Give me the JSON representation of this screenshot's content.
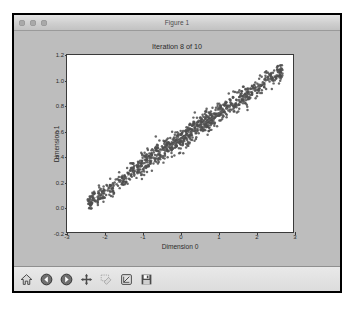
{
  "window": {
    "title": "Figure 1",
    "traffic_lights": [
      "close-button",
      "minimize-button",
      "zoom-button"
    ]
  },
  "toolbar": {
    "buttons": [
      {
        "name": "home-icon",
        "label": "Home",
        "enabled": true
      },
      {
        "name": "back-arrow-icon",
        "label": "Back",
        "enabled": true
      },
      {
        "name": "forward-arrow-icon",
        "label": "Forward",
        "enabled": true
      },
      {
        "name": "pan-move-icon",
        "label": "Pan",
        "enabled": true
      },
      {
        "name": "zoom-rect-icon",
        "label": "Zoom to rectangle",
        "enabled": false
      },
      {
        "name": "configure-subplots-icon",
        "label": "Configure subplots",
        "enabled": true
      },
      {
        "name": "save-disk-icon",
        "label": "Save the figure",
        "enabled": true
      }
    ]
  },
  "chart_data": {
    "type": "scatter",
    "title": "Iteration 8 of 10",
    "xlabel": "Dimension 0",
    "ylabel": "Dimension 1",
    "xlim": [
      -3,
      3
    ],
    "ylim": [
      -0.2,
      1.2
    ],
    "xticks": [
      -3,
      -2,
      -1,
      0,
      1,
      2,
      3
    ],
    "xticklabels": [
      "-3",
      "-2",
      "-1",
      "0",
      "1",
      "2",
      "3"
    ],
    "yticks": [
      -0.2,
      0.0,
      0.2,
      0.4,
      0.6,
      0.8,
      1.0,
      1.2
    ],
    "yticklabels": [
      "-0.2",
      "0.0",
      "0.2",
      "0.4",
      "0.6",
      "0.8",
      "1.0",
      "1.2"
    ],
    "grid": false,
    "legend": null,
    "marker_color": "#4d4d4d",
    "line_color": "#6b6b6b",
    "point_count": 1000,
    "series": [
      {
        "name": "samples",
        "type": "scatter",
        "note": "dense elongated cloud along a rising diagonal from about (-2.4, 0.03) to (2.7, 1.06)",
        "x_range": [
          -2.45,
          2.72
        ],
        "y_range": [
          -0.05,
          1.12
        ]
      },
      {
        "name": "fit-line",
        "type": "line",
        "note": "thin curve traced through the center of the cloud",
        "points": [
          [
            -2.42,
            0.035
          ],
          [
            -2.0,
            0.12
          ],
          [
            -1.5,
            0.22
          ],
          [
            -1.0,
            0.33
          ],
          [
            -0.5,
            0.44
          ],
          [
            0.0,
            0.53
          ],
          [
            0.5,
            0.63
          ],
          [
            1.0,
            0.73
          ],
          [
            1.5,
            0.83
          ],
          [
            2.0,
            0.93
          ],
          [
            2.45,
            1.03
          ],
          [
            2.68,
            1.055
          ]
        ]
      }
    ]
  }
}
